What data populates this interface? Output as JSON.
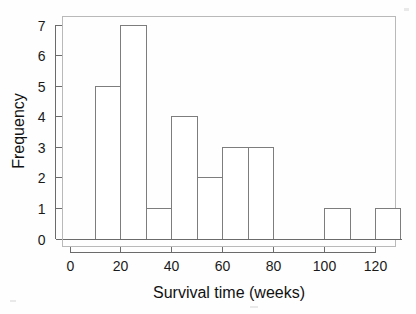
{
  "chart_data": {
    "type": "bar",
    "title": "",
    "xlabel": "Survival time (weeks)",
    "ylabel": "Frequency",
    "bin_width": 10,
    "bin_edges": [
      10,
      20,
      30,
      40,
      50,
      60,
      70,
      80,
      90,
      100,
      110,
      120,
      130
    ],
    "categories": [
      "10-20",
      "20-30",
      "30-40",
      "40-50",
      "50-60",
      "60-70",
      "70-80",
      "80-90",
      "90-100",
      "100-110",
      "110-120",
      "120-130"
    ],
    "values": [
      5,
      7,
      1,
      4,
      2,
      3,
      3,
      0,
      0,
      1,
      0,
      1
    ],
    "xlim": [
      0,
      130
    ],
    "ylim": [
      0,
      7.3
    ],
    "xticks": [
      0,
      20,
      40,
      60,
      80,
      100,
      120
    ],
    "xtick_labels": [
      "0",
      "20",
      "40",
      "60",
      "80",
      "100",
      "120"
    ],
    "yticks": [
      0,
      1,
      2,
      3,
      4,
      5,
      6,
      7
    ],
    "ytick_labels": [
      "0",
      "1",
      "2",
      "3",
      "4",
      "5",
      "6",
      "7"
    ],
    "grid": false,
    "legend": null,
    "bar_fill_color": "#ffffff",
    "bar_stroke_color": "#7d7d7d",
    "axis_color": "#6b6b6b"
  },
  "axes": {
    "x_title": "Survival time (weeks)",
    "y_title": "Frequency"
  }
}
